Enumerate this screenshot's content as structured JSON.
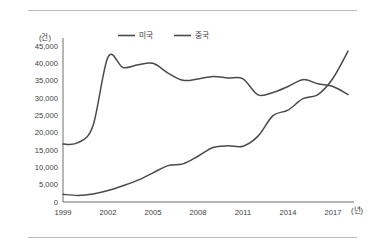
{
  "chart_data": {
    "type": "line",
    "title": "",
    "xlabel": "(년)",
    "ylabel": "(건)",
    "y_unit_label": "(건)",
    "x_unit_label": "(년)",
    "x": [
      1999,
      2000,
      2001,
      2002,
      2003,
      2004,
      2005,
      2006,
      2007,
      2008,
      2009,
      2010,
      2011,
      2012,
      2013,
      2014,
      2015,
      2016,
      2017,
      2018
    ],
    "xtick_labels": [
      "1999",
      "2002",
      "2005",
      "2008",
      "2011",
      "2014",
      "2017"
    ],
    "xticks": [
      1999,
      2002,
      2005,
      2008,
      2011,
      2014,
      2017
    ],
    "ytick_labels": [
      "0",
      "5,000",
      "10,000",
      "15,000",
      "20,000",
      "25,000",
      "30,000",
      "35,000",
      "40,000",
      "45,000"
    ],
    "yticks": [
      0,
      5000,
      10000,
      15000,
      20000,
      25000,
      30000,
      35000,
      40000,
      45000
    ],
    "ylim": [
      0,
      45000
    ],
    "xlim": [
      1999,
      2018
    ],
    "grid": false,
    "legend_position": "top-center",
    "series": [
      {
        "name": "미국",
        "color": "#4a4a4a",
        "values": [
          16700,
          17100,
          22000,
          41800,
          38800,
          39600,
          40000,
          37200,
          35100,
          35500,
          36200,
          35800,
          35500,
          30900,
          31600,
          33300,
          35300,
          34100,
          33300,
          31000
        ]
      },
      {
        "name": "중국",
        "color": "#4a4a4a",
        "values": [
          2200,
          1900,
          2300,
          3300,
          4700,
          6300,
          8400,
          10500,
          11000,
          13200,
          15700,
          16200,
          16100,
          19000,
          24900,
          26500,
          29800,
          31000,
          35700,
          43500
        ]
      }
    ]
  },
  "legend": {
    "items": [
      {
        "label": "미국"
      },
      {
        "label": "중국"
      }
    ]
  }
}
